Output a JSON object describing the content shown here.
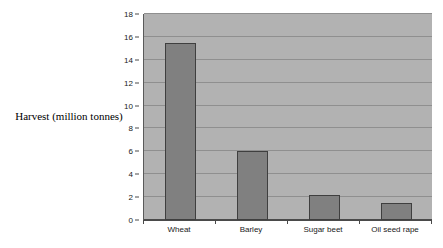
{
  "chart_data": {
    "type": "bar",
    "title": "",
    "subtitle": "",
    "xlabel": "",
    "ylabel": "Harvest (million tonnes)",
    "categories": [
      "Wheat",
      "Barley",
      "Sugar beet",
      "Oil seed rape"
    ],
    "values": [
      15.5,
      6.0,
      2.2,
      1.5
    ],
    "ylim": [
      0,
      18
    ],
    "ytick_step": 2,
    "ytick_labels": [
      "0",
      "2",
      "4",
      "6",
      "8",
      "10",
      "12",
      "14",
      "16",
      "18"
    ],
    "ytick_values": [
      0,
      2,
      4,
      6,
      8,
      10,
      12,
      14,
      16,
      18
    ],
    "grid": "horizontal",
    "legend": "none",
    "annotations": [],
    "series": [
      {
        "name": "Harvest",
        "values": [
          15.5,
          6.0,
          2.2,
          1.5
        ]
      }
    ]
  },
  "style": {
    "page_background": "#ffffff",
    "plot_background": "#b2b2b2",
    "bar_fill": "#808080",
    "bar_border": "#3f3f3f",
    "gridline_color": "#8f8f8f",
    "axis_color": "#4a4a4a",
    "text_color": "#1a1a1a"
  }
}
